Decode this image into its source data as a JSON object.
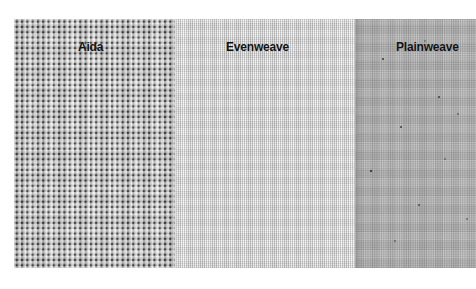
{
  "figure": {
    "kind": "fabric-comparison-photograph",
    "background": "#ffffff",
    "photo": {
      "left": 14,
      "top": 19,
      "width": 462,
      "height": 249
    }
  },
  "swatches": [
    {
      "id": "aida",
      "label": "Aida",
      "weave": "coarse open grid weave with visible square holes",
      "base_color": "#c2c2c2",
      "thread_color": "#787878",
      "hole_color": "#2b2b2b",
      "grid_pitch_px": 5.3
    },
    {
      "id": "evenweave",
      "label": "Evenweave",
      "weave": "fine pale even-count weave",
      "base_color": "#d3d3d3",
      "thread_color": "#9a9a9a",
      "grid_pitch_px": 2.0
    },
    {
      "id": "plainweave",
      "label": "Plainweave",
      "weave": "dense darker plain weave with small dark flecks",
      "base_color": "#a9a9a9",
      "thread_color": "#6e6e6e",
      "grid_pitch_px": 1.8
    }
  ],
  "label_style": {
    "color": "#111111",
    "weight": "bold",
    "size_px": 12
  }
}
